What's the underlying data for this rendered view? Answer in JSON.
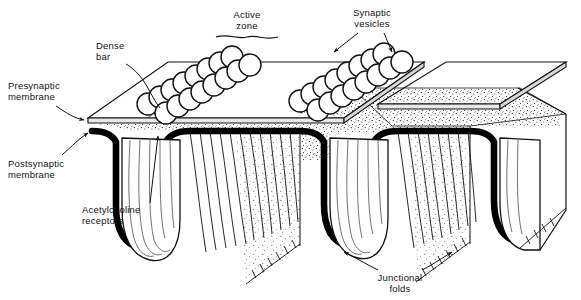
{
  "figure": {
    "style": "black-and-white line drawing with stipple shading",
    "background_color": "#ffffff",
    "ink_color": "#000000"
  },
  "labels": {
    "dense_bar": {
      "line1": "Dense",
      "line2": "bar"
    },
    "active_zone": {
      "line1": "Active",
      "line2": "zone"
    },
    "synaptic_vesicles": {
      "line1": "Synaptic",
      "line2": "vesicles"
    },
    "presynaptic": {
      "line1": "Presynaptic",
      "line2": "membrane"
    },
    "postsynaptic": {
      "line1": "Postsynaptic",
      "line2": "membrane"
    },
    "acetylcholine": {
      "line1": "Acetylcholine",
      "line2": "receptors"
    },
    "junctional_folds": {
      "line1": "Junctional",
      "line2": "folds"
    }
  },
  "structures": {
    "active_zones": 2,
    "junctional_folds": 3,
    "vesicle_rows_per_zone": 2,
    "vesicles_per_row": 8,
    "cleft_texture": "stipple",
    "postsynaptic_membrane_weight": "thick black"
  }
}
